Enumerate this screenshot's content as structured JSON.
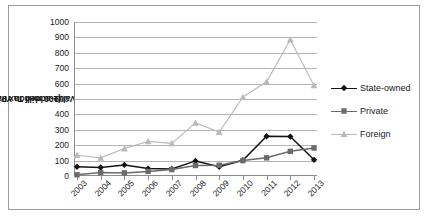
{
  "chart_data": {
    "type": "line",
    "title": "",
    "xlabel": "",
    "ylabel": "Value-added Tax Payable",
    "ylabel_unit": "(100 million Yuan)",
    "categories": [
      "2003",
      "2004",
      "2005",
      "2006",
      "2007",
      "2008",
      "2009",
      "2010",
      "2011",
      "2012",
      "2013"
    ],
    "ylim": [
      0,
      1000
    ],
    "ytick_step": 100,
    "yticks": [
      "0",
      "100",
      "200",
      "300",
      "400",
      "500",
      "600",
      "700",
      "800",
      "900",
      "1000"
    ],
    "grid": true,
    "legend_position": "right",
    "series": [
      {
        "name": "State-owned",
        "color": "#141414",
        "marker": "diamond",
        "values": [
          60,
          55,
          72,
          48,
          45,
          98,
          60,
          102,
          258,
          256,
          105
        ]
      },
      {
        "name": "Private",
        "color": "#6b6b6b",
        "marker": "square",
        "values": [
          8,
          22,
          20,
          30,
          42,
          68,
          70,
          100,
          118,
          160,
          182
        ]
      },
      {
        "name": "Foreign",
        "color": "#b9b9b9",
        "marker": "triangle",
        "values": [
          135,
          118,
          178,
          225,
          212,
          345,
          285,
          512,
          612,
          885,
          588
        ]
      }
    ]
  },
  "colors": {
    "plot_border": "#8c8c8c",
    "gridline": "#b4b4b4",
    "frame": "#9a9a9a",
    "background": "#ffffff",
    "text": "#1a1a1a"
  },
  "legend": {
    "items": [
      {
        "label": "State-owned"
      },
      {
        "label": "Private"
      },
      {
        "label": "Foreign"
      }
    ]
  }
}
